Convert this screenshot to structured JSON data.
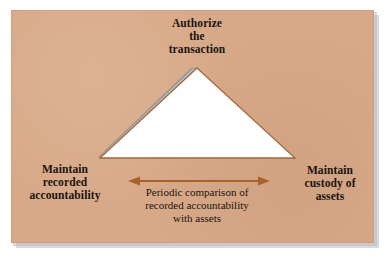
{
  "diagram": {
    "type": "triangle-relationship-diagram",
    "background_color": "#d8a988",
    "triangle_fill": "#ffffff",
    "triangle_outline_color": "#a5673f",
    "triangle_bevel_color": "#9a9a9a",
    "arrow_color": "#a9622c",
    "text_color": "#1a1410",
    "vertices": {
      "apex": {
        "name": "authorize-the-transaction",
        "lines": [
          "Authorize",
          "the",
          "transaction"
        ]
      },
      "bottom_left": {
        "name": "maintain-recorded-accountability",
        "lines": [
          "Maintain",
          "recorded",
          "accountability"
        ]
      },
      "bottom_right": {
        "name": "maintain-custody-of-assets",
        "lines": [
          "Maintain",
          "custody of",
          "assets"
        ]
      }
    },
    "base_connector": {
      "name": "periodic-comparison",
      "arrow_style": "double-headed",
      "lines": [
        "Periodic comparison of",
        "recorded accountability",
        "with assets"
      ]
    }
  }
}
